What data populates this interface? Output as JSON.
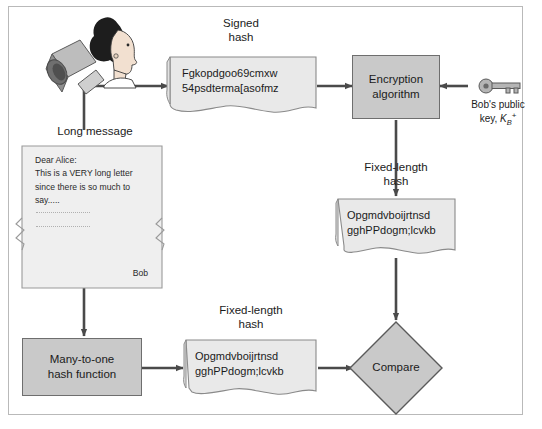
{
  "diagram": {
    "colors": {
      "process_fill": "#c9c9c9",
      "document_fill": "#e9e9e9",
      "border": "#6e6e6e",
      "arrow": "#4a4a4a",
      "frame": "#b9b9b9",
      "text": "#1b1b1b"
    },
    "captions": {
      "signed_hash": "Signed\nhash",
      "long_message": "Long message",
      "fixed_length_hash_top": "Fixed-length\nhash",
      "fixed_length_hash_bottom": "Fixed-length\nhash"
    },
    "nodes": {
      "signer": {
        "name": "bob-figure",
        "label": ""
      },
      "signed_hash_doc": {
        "label": "Fgkopdgoo69cmxw\n54psdterma[asofmz"
      },
      "encryption_algorithm": {
        "label": "Encryption\nalgorithm"
      },
      "public_key": {
        "label_line1": "Bob's public",
        "label_line2_prefix": "key, ",
        "key_symbol": "K",
        "key_subscript": "B",
        "key_superscript": "+"
      },
      "decrypted_hash_doc": {
        "label": "Opgmdvboijrtnsd\ngghPPdogm;lcvkb"
      },
      "letter": {
        "body": "Dear Alice:\nThis is a VERY long letter\nsince there is so much to\nsay.....",
        "signature": "Bob"
      },
      "hash_function": {
        "label": "Many-to-one\nhash function"
      },
      "computed_hash_doc": {
        "label": "Opgmdvboijrtnsd\ngghPPdogm;lcvkb"
      },
      "compare": {
        "label": "Compare"
      }
    }
  }
}
